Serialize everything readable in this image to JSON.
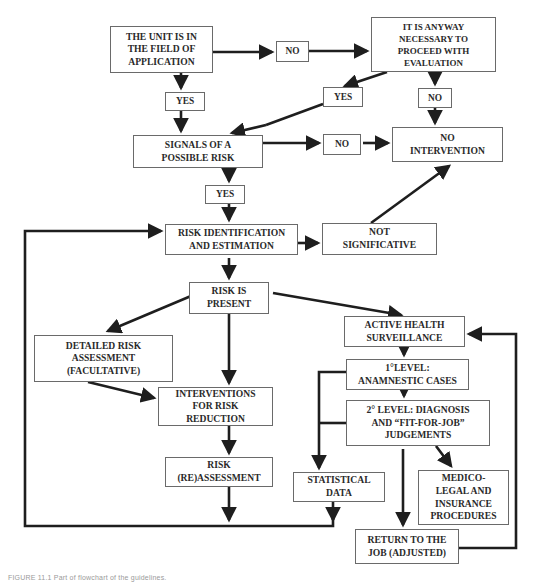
{
  "flowchart": {
    "nodes": {
      "unit_in_field": "THE UNIT IS IN\nTHE FIELD OF\nAPPLICATION",
      "anyway_necessary": "IT IS ANYWAY\nNECESSARY TO\nPROCEED WITH\nEVALUATION",
      "signals": "SIGNALS OF A\nPOSSIBLE RISK",
      "no_intervention": "NO\nINTERVENTION",
      "risk_identification": "RISK IDENTIFICATION\nAND ESTIMATION",
      "not_significative": "NOT\nSIGNIFICATIVE",
      "risk_present": "RISK IS\nPRESENT",
      "detailed_assessment": "DETAILED RISK\nASSESSMENT\n(FACULTATIVE)",
      "active_surveillance": "ACTIVE HEALTH\nSURVEILLANCE",
      "level1": "1°LEVEL:\nANAMNESTIC CASES",
      "interventions": "INTERVENTIONS\nFOR RISK\nREDUCTION",
      "level2": "2° LEVEL: DIAGNOSIS\nAND “FIT-FOR-JOB”\nJUDGEMENTS",
      "reassessment": "RISK\n(RE)ASSESSMENT",
      "statistical_data": "STATISTICAL\nDATA",
      "medico_legal": "MEDICO-\nLEGAL AND\nINSURANCE\nPROCEDURES",
      "return_to_job": "RETURN TO THE\nJOB (ADJUSTED)"
    },
    "labels": {
      "no_top": "NO",
      "yes_left": "YES",
      "yes_mid": "YES",
      "no_right": "NO",
      "no_mid": "NO",
      "yes_signals": "YES"
    },
    "line_color": "#1e1e1e",
    "border_color": "#6a6a6a"
  },
  "caption": "FIGURE 11.1   Part of flowchart of the guidelines."
}
